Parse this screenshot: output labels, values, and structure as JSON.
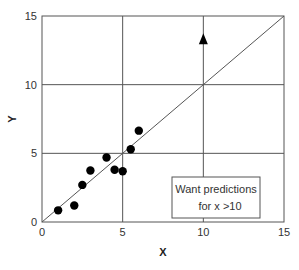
{
  "chart_data": {
    "type": "scatter",
    "title": "",
    "xlabel": "X",
    "ylabel": "Y",
    "xlim": [
      0,
      15
    ],
    "ylim": [
      0,
      15
    ],
    "xticks": [
      0,
      5,
      10,
      15
    ],
    "yticks": [
      0,
      5,
      10,
      15
    ],
    "xtick_labels": [
      "0",
      "5",
      "10",
      "15"
    ],
    "ytick_labels": [
      "0",
      "5",
      "10",
      "15"
    ],
    "grid": true,
    "series": [
      {
        "name": "observed",
        "marker": "circle",
        "color": "#000000",
        "points": [
          {
            "x": 1.0,
            "y": 0.85
          },
          {
            "x": 2.0,
            "y": 1.2
          },
          {
            "x": 2.5,
            "y": 2.7
          },
          {
            "x": 3.0,
            "y": 3.75
          },
          {
            "x": 4.0,
            "y": 4.7
          },
          {
            "x": 4.5,
            "y": 3.8
          },
          {
            "x": 5.0,
            "y": 3.7
          },
          {
            "x": 5.5,
            "y": 5.3
          },
          {
            "x": 6.0,
            "y": 6.65
          }
        ]
      },
      {
        "name": "prediction",
        "marker": "triangle",
        "color": "#000000",
        "points": [
          {
            "x": 10.0,
            "y": 13.3
          }
        ]
      }
    ],
    "fit_line": {
      "x1": 0,
      "y1": 0,
      "x2": 15,
      "y2": 15,
      "color": "#555555"
    },
    "annotation": {
      "lines": [
        "Want predictions",
        "for x >10"
      ],
      "placement": "bottom-right"
    }
  }
}
